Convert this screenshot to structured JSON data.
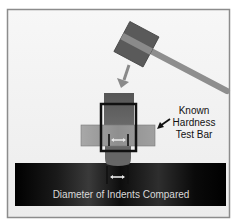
{
  "diagram": {
    "labels": {
      "test_bar": [
        "Known",
        "Hardness",
        "Test Bar"
      ],
      "bottom_caption": "Diameter of Indents Compared"
    },
    "components": [
      {
        "id": "hammer",
        "label": "Hammer"
      },
      {
        "id": "strike-arrow",
        "label": "Direction of strike"
      },
      {
        "id": "holder",
        "label": "Tester holder"
      },
      {
        "id": "test-bar",
        "label": "Known Hardness Test Bar"
      },
      {
        "id": "indenter-ball",
        "label": "Ball indenter"
      },
      {
        "id": "workpiece",
        "label": "Test piece"
      }
    ],
    "colors": {
      "background": "#f2f2f2",
      "frame": "#8c8c8c",
      "hammer_head": "#5a5a5a",
      "hammer_stripe": "#8a8a8a",
      "handle": "#8e8e8e",
      "holder": "#5c5c5c",
      "test_bar": "#9a9a9a",
      "outline_box": "#111111",
      "indenter": "#6a6a6a",
      "workpiece": "#0a0a0a",
      "caption_text": "#d9d9d9",
      "measure_arrow": "#e6e6e6"
    }
  }
}
